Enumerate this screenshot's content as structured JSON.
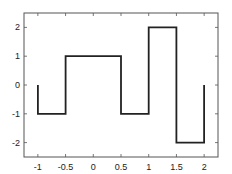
{
  "chart_data": {
    "type": "line",
    "title": "",
    "xlabel": "",
    "ylabel": "",
    "xlim": [
      -1.25,
      2.25
    ],
    "ylim": [
      -2.5,
      2.5
    ],
    "grid": false,
    "legend": null,
    "x_ticks": [
      -1,
      -0.5,
      0,
      0.5,
      1,
      1.5,
      2
    ],
    "x_tick_labels": [
      "-1",
      "-0.5",
      "0",
      "0.5",
      "1",
      "1.5",
      "2"
    ],
    "y_ticks": [
      -2,
      -1,
      0,
      1,
      2
    ],
    "y_tick_labels": [
      "-2",
      "-1",
      "0",
      "1",
      "2"
    ],
    "series": [
      {
        "name": "step",
        "color": "#222222",
        "x": [
          -1,
          -1,
          -0.5,
          -0.5,
          0.5,
          0.5,
          1,
          1,
          1.5,
          1.5,
          2,
          2
        ],
        "y": [
          0,
          -1,
          -1,
          1,
          1,
          -1,
          -1,
          2,
          2,
          -2,
          -2,
          0
        ]
      }
    ]
  }
}
